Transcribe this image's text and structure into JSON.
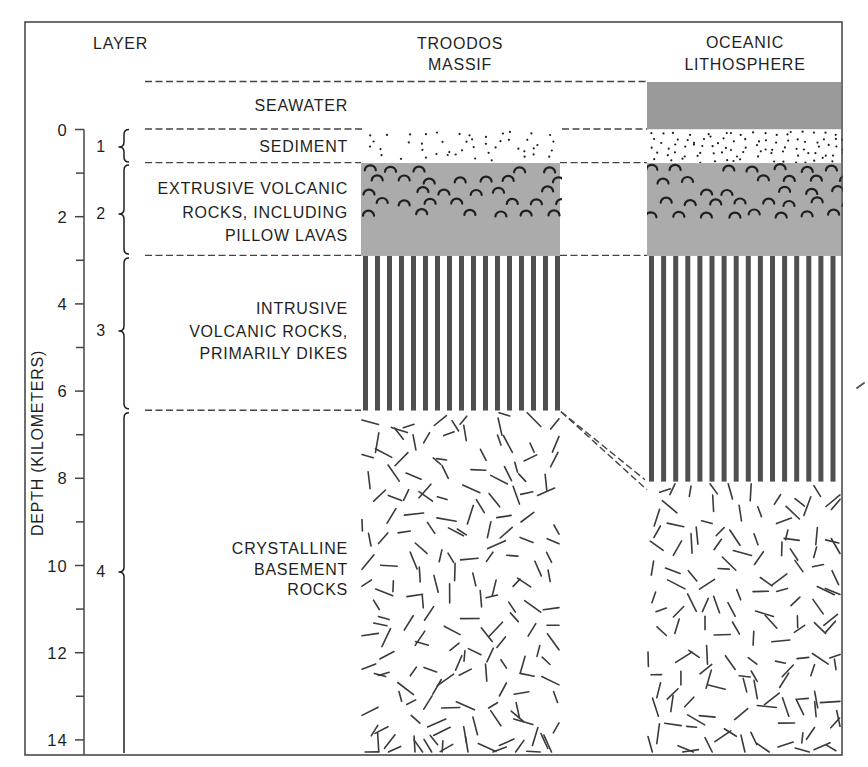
{
  "header": {
    "layer_heading": "LAYER",
    "columns": [
      {
        "id": "troodos",
        "title_lines": [
          "TROODOS",
          "MASSIF"
        ]
      },
      {
        "id": "oceanic",
        "title_lines": [
          "OCEANIC",
          "LITHOSPHERE"
        ]
      }
    ]
  },
  "depth_axis": {
    "label": "DEPTH (KILOMETERS)",
    "unit": "km",
    "range_km": [
      0,
      14
    ],
    "major_ticks": [
      0,
      2,
      4,
      6,
      8,
      10,
      12,
      14
    ],
    "tick_labels": [
      "0",
      "2",
      "4",
      "6",
      "8",
      "10",
      "12",
      "14"
    ],
    "minor_ticks": [
      1,
      3,
      5,
      7,
      9,
      11,
      13
    ]
  },
  "seawater": {
    "label": "SEAWATER"
  },
  "layers": [
    {
      "number": "1",
      "label_lines": [
        "SEDIMENT"
      ]
    },
    {
      "number": "2",
      "label_lines": [
        "EXTRUSIVE VOLCANIC",
        "ROCKS, INCLUDING",
        "PILLOW LAVAS"
      ]
    },
    {
      "number": "3",
      "label_lines": [
        "INTRUSIVE",
        "VOLCANIC ROCKS,",
        "PRIMARILY DIKES"
      ]
    },
    {
      "number": "4",
      "label_lines": [
        "CRYSTALLINE",
        "BASEMENT",
        "ROCKS"
      ]
    }
  ],
  "boundaries_km": {
    "seawater_top": -1.09,
    "sediment_top": 0,
    "sediment_base": 0.77,
    "layer2_base": 2.9,
    "troodos_layer3_base": 6.45,
    "oceanic_layer3_base": 8.08,
    "section_bottom": 14.3
  },
  "sections": {
    "troodos": [
      {
        "unit": "sediment",
        "pattern": "dots",
        "top_km": 0,
        "bottom_km": 0.77
      },
      {
        "unit": "extrusive",
        "pattern": "pillow-arcs-on-gray",
        "top_km": 0.77,
        "bottom_km": 2.9
      },
      {
        "unit": "intrusive",
        "pattern": "vertical-dikes",
        "top_km": 2.9,
        "bottom_km": 6.45
      },
      {
        "unit": "crystalline",
        "pattern": "random-dashes",
        "top_km": 6.45,
        "bottom_km": 14.3
      }
    ],
    "oceanic": [
      {
        "unit": "seawater",
        "pattern": "solid-gray",
        "top_km": -1.09,
        "bottom_km": 0
      },
      {
        "unit": "sediment",
        "pattern": "dots",
        "top_km": 0,
        "bottom_km": 0.77
      },
      {
        "unit": "extrusive",
        "pattern": "pillow-arcs-on-gray",
        "top_km": 0.77,
        "bottom_km": 2.9
      },
      {
        "unit": "intrusive",
        "pattern": "vertical-dikes",
        "top_km": 2.9,
        "bottom_km": 8.08
      },
      {
        "unit": "crystalline",
        "pattern": "random-dashes",
        "top_km": 8.08,
        "bottom_km": 14.3
      }
    ]
  },
  "colors": {
    "background": "#ffffff",
    "seawater": "#9a9a9a",
    "extrusive": "#ababab",
    "dike": "#4f4f4f",
    "ink": "#1f1f1f",
    "crystal": "#3a3a3a",
    "line": "#444444",
    "frame": "#4a4a4a"
  }
}
